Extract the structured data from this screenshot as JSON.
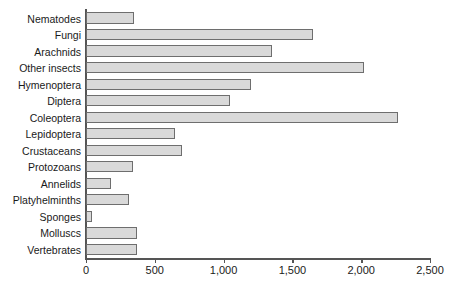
{
  "chart_data": {
    "type": "bar",
    "orientation": "horizontal",
    "title": "",
    "xlabel": "",
    "ylabel": "",
    "xlim": [
      0,
      2500
    ],
    "xticks": [
      0,
      500,
      1000,
      1500,
      2000,
      2500
    ],
    "xtick_labels": [
      "0",
      "500",
      "1,000",
      "1,500",
      "2,000",
      "2,500"
    ],
    "grid": false,
    "legend": false,
    "bar_fill_color": "#d9d9d9",
    "bar_edge_color": "#6e6e6e",
    "axis_color": "#555555",
    "categories": [
      "Nematodes",
      "Fungi",
      "Arachnids",
      "Other insects",
      "Hymenoptera",
      "Diptera",
      "Coleoptera",
      "Lepidoptera",
      "Crustaceans",
      "Protozoans",
      "Annelids",
      "Platyhelminths",
      "Sponges",
      "Molluscs",
      "Vertebrates"
    ],
    "values": [
      350,
      1650,
      1350,
      2020,
      1200,
      1050,
      2270,
      650,
      700,
      340,
      180,
      310,
      40,
      370,
      370
    ]
  }
}
